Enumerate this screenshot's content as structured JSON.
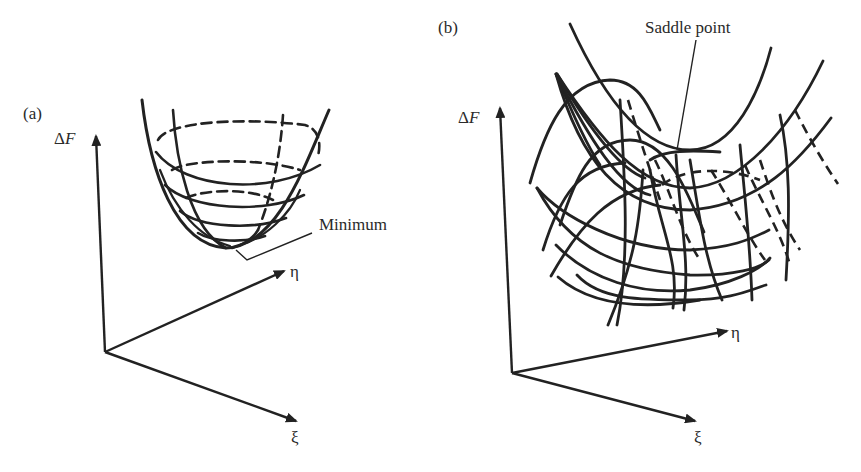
{
  "panels": [
    {
      "label": "(a)",
      "y_axis": {
        "delta": "Δ",
        "var": "F"
      },
      "axis_eta": "η",
      "axis_xi": "ξ",
      "annotation": "Minimum"
    },
    {
      "label": "(b)",
      "y_axis": {
        "delta": "Δ",
        "var": "F"
      },
      "axis_eta": "η",
      "axis_xi": "ξ",
      "annotation": "Saddle point"
    }
  ],
  "colors": {
    "ink": "#222222",
    "background": "#ffffff"
  }
}
